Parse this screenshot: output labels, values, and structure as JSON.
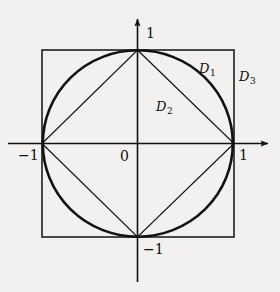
{
  "figure": {
    "background_color": "#f2f1ef",
    "stroke_color": "#111111",
    "axis_labels": {
      "y_top": "1",
      "x_right": "1",
      "x_left": "−1",
      "y_bottom": "−1",
      "origin": "0"
    },
    "regions": [
      {
        "id": "D1",
        "base": "D",
        "subscript": "1",
        "description": "region inside circle outside diamond"
      },
      {
        "id": "D2",
        "base": "D",
        "subscript": "2",
        "description": "region inside diamond"
      },
      {
        "id": "D3",
        "base": "D",
        "subscript": "3",
        "description": "region inside square outside circle"
      }
    ],
    "geometry": {
      "center": [
        137.5,
        143.5
      ],
      "circle_radius": 94,
      "square": {
        "x": 42,
        "y": 50,
        "width": 192,
        "height": 187
      },
      "diamond_vertices": [
        [
          137.5,
          50
        ],
        [
          234,
          143.5
        ],
        [
          137.5,
          237
        ],
        [
          42,
          143.5
        ]
      ],
      "x_axis": {
        "from": [
          8,
          143.5
        ],
        "to": [
          272,
          143.5
        ],
        "arrow": "right"
      },
      "y_axis": {
        "from": [
          137.5,
          282
        ],
        "to": [
          137.5,
          15
        ],
        "arrow": "up"
      },
      "circle_stroke_width": 2.6,
      "square_stroke_width": 1.5,
      "diamond_stroke_width": 1.2,
      "axis_stroke_width": 1.6
    }
  }
}
